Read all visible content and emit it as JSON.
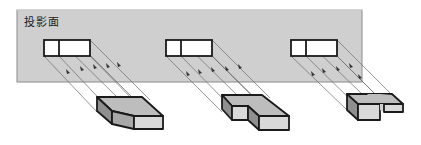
{
  "diagram": {
    "plane_label": "投影面",
    "colors": {
      "plane_fill": "#cfcfcf",
      "plane_border": "#8a8a8a",
      "outline": "#1a1a1a",
      "projection_line": "#6a6a6a",
      "top_face": "#bdbdbd",
      "side_face": "#8f8f8f",
      "front_face": "#d9d9d9",
      "rect_fill": "#ffffff"
    },
    "projections": [
      {
        "id": "projection-1",
        "shape": "chamfered-block",
        "view": "two-cell rectangle"
      },
      {
        "id": "projection-2",
        "shape": "notched-L-block",
        "view": "two-cell rectangle"
      },
      {
        "id": "projection-3",
        "shape": "U-slot-block",
        "view": "two-cell rectangle"
      }
    ]
  }
}
